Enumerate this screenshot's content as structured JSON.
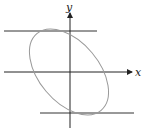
{
  "diagram": {
    "axes": {
      "x_label": "x",
      "y_label": "y"
    },
    "colors": {
      "axis": "#222222",
      "ellipse": "#999999",
      "tangent": "#333333"
    },
    "elements": [
      {
        "type": "ellipse",
        "rotation_deg": 50,
        "description": "tilted ellipse centered near origin"
      },
      {
        "type": "horizontal-line",
        "description": "upper horizontal tangent line"
      },
      {
        "type": "horizontal-line",
        "description": "lower horizontal tangent line"
      }
    ]
  }
}
